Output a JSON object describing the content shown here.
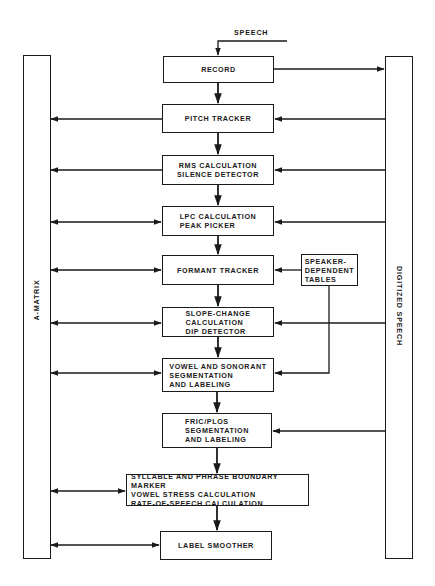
{
  "diagram": {
    "input_label": "SPEECH",
    "left_bar": {
      "label": "A-MATRIX"
    },
    "right_bar": {
      "label": "DIGITIZED SPEECH"
    },
    "boxes": [
      {
        "id": "record",
        "lines": [
          "RECORD"
        ]
      },
      {
        "id": "pitch-tracker",
        "lines": [
          "PITCH TRACKER"
        ]
      },
      {
        "id": "rms-calculation",
        "lines": [
          "RMS CALCULATION",
          "SILENCE DETECTOR"
        ]
      },
      {
        "id": "lpc-calculation",
        "lines": [
          "LPC CALCULATION",
          "PEAK PICKER"
        ]
      },
      {
        "id": "formant-tracker",
        "lines": [
          "FORMANT TRACKER"
        ]
      },
      {
        "id": "speaker-dependent-tables",
        "lines": [
          "SPEAKER-",
          "DEPENDENT",
          "TABLES"
        ]
      },
      {
        "id": "slope-change",
        "lines": [
          "SLOPE-CHANGE",
          "CALCULATION",
          "DIP DETECTOR"
        ]
      },
      {
        "id": "vowel-sonorant",
        "lines": [
          "VOWEL AND SONORANT",
          "SEGMENTATION",
          "AND LABELING"
        ]
      },
      {
        "id": "fric-plos",
        "lines": [
          "FRIC/PLOS",
          "SEGMENTATION",
          "AND LABELING"
        ]
      },
      {
        "id": "syllable-phrase",
        "lines": [
          "SYLLABLE AND PHRASE BOUNDARY MARKER",
          "VOWEL STRESS CALCULATION",
          "RATE-OF-SPEECH CALCULATION"
        ]
      },
      {
        "id": "label-smoother",
        "lines": [
          "LABEL SMOOTHER"
        ]
      }
    ],
    "connections": [
      {
        "from": "SPEECH",
        "to": "record"
      },
      {
        "from": "record",
        "to": "pitch-tracker"
      },
      {
        "from": "record",
        "to": "DIGITIZED SPEECH"
      },
      {
        "from": "pitch-tracker",
        "to": "rms-calculation"
      },
      {
        "from": "pitch-tracker",
        "to": "A-MATRIX"
      },
      {
        "from": "DIGITIZED SPEECH",
        "to": "pitch-tracker"
      },
      {
        "from": "rms-calculation",
        "to": "lpc-calculation"
      },
      {
        "from": "rms-calculation",
        "to": "A-MATRIX"
      },
      {
        "from": "DIGITIZED SPEECH",
        "to": "rms-calculation"
      },
      {
        "from": "lpc-calculation",
        "to": "formant-tracker"
      },
      {
        "from": "lpc-calculation",
        "to": "A-MATRIX",
        "bidirectional": true
      },
      {
        "from": "DIGITIZED SPEECH",
        "to": "lpc-calculation"
      },
      {
        "from": "formant-tracker",
        "to": "slope-change"
      },
      {
        "from": "formant-tracker",
        "to": "A-MATRIX",
        "bidirectional": true
      },
      {
        "from": "speaker-dependent-tables",
        "to": "formant-tracker"
      },
      {
        "from": "speaker-dependent-tables",
        "to": "vowel-sonorant"
      },
      {
        "from": "slope-change",
        "to": "vowel-sonorant"
      },
      {
        "from": "slope-change",
        "to": "A-MATRIX",
        "bidirectional": true
      },
      {
        "from": "DIGITIZED SPEECH",
        "to": "slope-change"
      },
      {
        "from": "vowel-sonorant",
        "to": "fric-plos"
      },
      {
        "from": "vowel-sonorant",
        "to": "A-MATRIX",
        "bidirectional": true
      },
      {
        "from": "fric-plos",
        "to": "syllable-phrase"
      },
      {
        "from": "DIGITIZED SPEECH",
        "to": "fric-plos"
      },
      {
        "from": "syllable-phrase",
        "to": "label-smoother"
      },
      {
        "from": "syllable-phrase",
        "to": "A-MATRIX",
        "bidirectional": true
      },
      {
        "from": "label-smoother",
        "to": "A-MATRIX",
        "bidirectional": true
      }
    ]
  }
}
